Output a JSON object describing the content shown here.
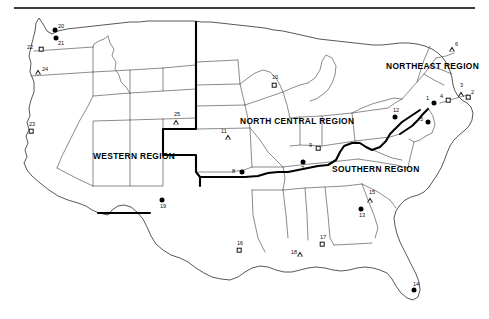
{
  "figure": {
    "top_rule": true
  },
  "regions": [
    {
      "id": "western",
      "label": "WESTERN REGION",
      "x": 93,
      "y": 152
    },
    {
      "id": "north-central",
      "label": "NORTH CENTRAL REGION",
      "x": 240,
      "y": 117
    },
    {
      "id": "northeast",
      "label": "NORTHEAST REGION",
      "x": 386,
      "y": 62
    },
    {
      "id": "southern",
      "label": "SOUTHERN REGION",
      "x": 332,
      "y": 165
    }
  ],
  "legend_symbols": {
    "circle": "filled-circle",
    "square": "open-square",
    "triangle": "open-triangle"
  },
  "sites": [
    {
      "num": "1",
      "symbol": "circle",
      "x": 434,
      "y": 103,
      "lx": -8,
      "ly": -8,
      "region": "northeast"
    },
    {
      "num": "2",
      "symbol": "square",
      "x": 468,
      "y": 97,
      "lx": 3,
      "ly": -8,
      "region": "northeast"
    },
    {
      "num": "3",
      "symbol": "triangle",
      "x": 461,
      "y": 94,
      "lx": -1,
      "ly": -12,
      "region": "northeast"
    },
    {
      "num": "4",
      "symbol": "square",
      "x": 448,
      "y": 100,
      "lx": -8,
      "ly": -7,
      "region": "northeast"
    },
    {
      "num": "5",
      "symbol": "circle",
      "x": 428,
      "y": 122,
      "lx": -8,
      "ly": -6,
      "region": "northeast"
    },
    {
      "num": "6",
      "symbol": "triangle",
      "x": 452,
      "y": 49,
      "lx": 3,
      "ly": -8,
      "region": "northeast"
    },
    {
      "num": "7",
      "symbol": "circle",
      "x": 303,
      "y": 162,
      "lx": -2,
      "ly": 3,
      "region": "north-central"
    },
    {
      "num": "8",
      "symbol": "circle",
      "x": 242,
      "y": 172,
      "lx": -10,
      "ly": -4,
      "region": "north-central"
    },
    {
      "num": "9",
      "symbol": "square",
      "x": 318,
      "y": 148,
      "lx": -9,
      "ly": -6,
      "region": "north-central"
    },
    {
      "num": "10",
      "symbol": "square",
      "x": 274,
      "y": 85,
      "lx": -2,
      "ly": -11,
      "region": "north-central"
    },
    {
      "num": "11",
      "symbol": "triangle",
      "x": 228,
      "y": 137,
      "lx": -7,
      "ly": -9,
      "region": "north-central"
    },
    {
      "num": "12",
      "symbol": "circle",
      "x": 395,
      "y": 117,
      "lx": -2,
      "ly": -10,
      "region": "northeast"
    },
    {
      "num": "13",
      "symbol": "circle",
      "x": 361,
      "y": 209,
      "lx": -2,
      "ly": 3,
      "region": "southern"
    },
    {
      "num": "14",
      "symbol": "circle",
      "x": 414,
      "y": 290,
      "lx": -1,
      "ly": -9,
      "region": "southern"
    },
    {
      "num": "15",
      "symbol": "triangle",
      "x": 370,
      "y": 200,
      "lx": -1,
      "ly": -11,
      "region": "southern"
    },
    {
      "num": "16",
      "symbol": "square",
      "x": 239,
      "y": 250,
      "lx": -2,
      "ly": -10,
      "region": "southern"
    },
    {
      "num": "17",
      "symbol": "square",
      "x": 322,
      "y": 244,
      "lx": -2,
      "ly": -10,
      "region": "southern"
    },
    {
      "num": "18",
      "symbol": "triangle",
      "x": 300,
      "y": 254,
      "lx": -9,
      "ly": -5,
      "region": "southern"
    },
    {
      "num": "19",
      "symbol": "circle",
      "x": 162,
      "y": 200,
      "lx": -2,
      "ly": 3,
      "region": "western"
    },
    {
      "num": "20",
      "symbol": "circle",
      "x": 55,
      "y": 30,
      "lx": 3,
      "ly": -7,
      "region": "western"
    },
    {
      "num": "21",
      "symbol": "circle",
      "x": 56,
      "y": 38,
      "lx": 2,
      "ly": 2,
      "region": "western"
    },
    {
      "num": "22",
      "symbol": "square",
      "x": 41,
      "y": 49,
      "lx": -14,
      "ly": -5,
      "region": "western"
    },
    {
      "num": "23",
      "symbol": "square",
      "x": 31,
      "y": 131,
      "lx": -2,
      "ly": -10,
      "region": "western"
    },
    {
      "num": "24",
      "symbol": "triangle",
      "x": 38,
      "y": 72,
      "lx": 4,
      "ly": -6,
      "region": "western"
    },
    {
      "num": "25",
      "symbol": "triangle",
      "x": 176,
      "y": 122,
      "lx": -2,
      "ly": -11,
      "region": "western"
    }
  ]
}
